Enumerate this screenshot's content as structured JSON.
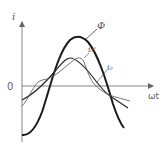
{
  "diagram": {
    "type": "waveform",
    "axes": {
      "y_label": "i",
      "x_label": "ωt",
      "origin_label": "0"
    },
    "curves": [
      {
        "id": "phi",
        "label": "Φ",
        "description": "magnetic flux, large-amplitude sinusoid",
        "stroke": "#1a1a1a",
        "width": 2.0
      },
      {
        "id": "i0_prime",
        "label": "i₀'",
        "description": "distorted (peaked) magnetizing current",
        "stroke": "#555555",
        "width": 0.8
      },
      {
        "id": "i0",
        "label": "i₀",
        "description": "magnetizing current",
        "stroke": "#2a2a2a",
        "width": 1.2
      }
    ],
    "colors": {
      "axis": "#777777",
      "text": "#555555"
    }
  }
}
